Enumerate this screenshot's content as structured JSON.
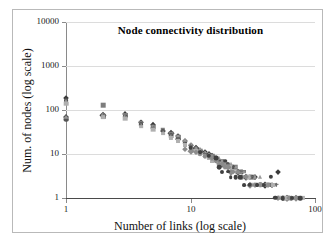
{
  "chart_data": {
    "type": "scatter",
    "title": "Node connectivity distribution",
    "xlabel": "Number of links (log scale)",
    "ylabel": "Num. of nodes (log scale)",
    "xscale": "log",
    "yscale": "log",
    "xlim": [
      1,
      100
    ],
    "ylim": [
      1,
      10000
    ],
    "xticks": [
      "1",
      "10",
      "100"
    ],
    "xtick_values": [
      1,
      10,
      100
    ],
    "yticks": [
      "1",
      "10",
      "100",
      "1000",
      "10000"
    ],
    "ytick_values": [
      1,
      10,
      100,
      1000,
      10000
    ],
    "grid": true,
    "grid_axis": "y",
    "legend": "none",
    "series": [
      {
        "name": "net-a",
        "marker": "diamond",
        "color": "#3a3a3a",
        "points": [
          [
            1,
            185
          ],
          [
            1,
            70
          ],
          [
            2,
            78
          ],
          [
            3,
            80
          ],
          [
            4,
            52
          ],
          [
            5,
            46
          ],
          [
            6,
            34
          ],
          [
            7,
            30
          ],
          [
            8,
            26
          ],
          [
            9,
            20
          ],
          [
            10,
            16
          ],
          [
            11,
            14
          ],
          [
            12,
            12
          ],
          [
            13,
            11
          ],
          [
            14,
            10
          ],
          [
            15,
            9
          ],
          [
            16,
            8
          ],
          [
            17,
            7
          ],
          [
            18,
            6
          ],
          [
            19,
            6
          ],
          [
            20,
            5
          ],
          [
            22,
            5
          ],
          [
            24,
            4
          ],
          [
            26,
            4
          ],
          [
            28,
            3
          ],
          [
            30,
            3
          ],
          [
            33,
            3
          ],
          [
            36,
            2
          ],
          [
            40,
            2
          ],
          [
            45,
            2
          ],
          [
            50,
            4
          ],
          [
            55,
            1
          ],
          [
            60,
            1
          ],
          [
            70,
            1
          ]
        ]
      },
      {
        "name": "net-b",
        "marker": "square",
        "color": "#7d7d7d",
        "points": [
          [
            1,
            150
          ],
          [
            1,
            64
          ],
          [
            2,
            130
          ],
          [
            2,
            72
          ],
          [
            3,
            76
          ],
          [
            4,
            50
          ],
          [
            5,
            42
          ],
          [
            6,
            36
          ],
          [
            7,
            28
          ],
          [
            8,
            24
          ],
          [
            9,
            19
          ],
          [
            10,
            15
          ],
          [
            11,
            13
          ],
          [
            12,
            12
          ],
          [
            13,
            10
          ],
          [
            14,
            9
          ],
          [
            15,
            9
          ],
          [
            16,
            8
          ],
          [
            17,
            7
          ],
          [
            18,
            7
          ],
          [
            19,
            6
          ],
          [
            21,
            5
          ],
          [
            23,
            5
          ],
          [
            25,
            4
          ],
          [
            27,
            4
          ],
          [
            29,
            3
          ],
          [
            32,
            3
          ],
          [
            35,
            2
          ],
          [
            38,
            2
          ],
          [
            42,
            2
          ],
          [
            48,
            2
          ],
          [
            52,
            1
          ],
          [
            58,
            1
          ],
          [
            66,
            1
          ],
          [
            75,
            1
          ]
        ]
      },
      {
        "name": "net-c",
        "marker": "circle",
        "color": "#555555",
        "points": [
          [
            1,
            170
          ],
          [
            1,
            60
          ],
          [
            2,
            74
          ],
          [
            3,
            70
          ],
          [
            4,
            48
          ],
          [
            5,
            40
          ],
          [
            6,
            33
          ],
          [
            7,
            27
          ],
          [
            8,
            22
          ],
          [
            9,
            18
          ],
          [
            10,
            14
          ],
          [
            11,
            13
          ],
          [
            12,
            11
          ],
          [
            13,
            10
          ],
          [
            14,
            9
          ],
          [
            15,
            8
          ],
          [
            16,
            7
          ],
          [
            17,
            7
          ],
          [
            18,
            6
          ],
          [
            20,
            6
          ],
          [
            22,
            5
          ],
          [
            24,
            4
          ],
          [
            26,
            3
          ],
          [
            28,
            3
          ],
          [
            31,
            3
          ],
          [
            34,
            2
          ],
          [
            37,
            2
          ],
          [
            41,
            2
          ],
          [
            46,
            2
          ],
          [
            51,
            1
          ],
          [
            57,
            1
          ],
          [
            64,
            1
          ],
          [
            72,
            1
          ]
        ]
      },
      {
        "name": "net-d",
        "marker": "triangle",
        "color": "#999999",
        "points": [
          [
            1,
            160
          ],
          [
            1,
            68
          ],
          [
            2,
            80
          ],
          [
            3,
            72
          ],
          [
            4,
            46
          ],
          [
            5,
            44
          ],
          [
            6,
            32
          ],
          [
            7,
            26
          ],
          [
            8,
            25
          ],
          [
            9,
            21
          ],
          [
            10,
            17
          ],
          [
            11,
            14
          ],
          [
            12,
            13
          ],
          [
            13,
            11
          ],
          [
            14,
            10
          ],
          [
            15,
            9
          ],
          [
            16,
            8
          ],
          [
            17,
            8
          ],
          [
            18,
            7
          ],
          [
            19,
            6
          ],
          [
            21,
            6
          ],
          [
            23,
            5
          ],
          [
            25,
            4
          ],
          [
            27,
            4
          ],
          [
            30,
            3
          ],
          [
            33,
            3
          ],
          [
            36,
            3
          ],
          [
            39,
            2
          ],
          [
            43,
            2
          ],
          [
            47,
            2
          ],
          [
            54,
            1
          ],
          [
            61,
            1
          ],
          [
            68,
            1
          ]
        ]
      },
      {
        "name": "net-e",
        "marker": "cross",
        "color": "#6a6a6a",
        "points": [
          [
            2,
            76
          ],
          [
            3,
            68
          ],
          [
            4,
            44
          ],
          [
            5,
            38
          ],
          [
            6,
            30
          ],
          [
            7,
            24
          ],
          [
            8,
            21
          ],
          [
            9,
            17
          ],
          [
            10,
            15
          ],
          [
            11,
            12
          ],
          [
            12,
            11
          ],
          [
            13,
            10
          ],
          [
            14,
            8
          ],
          [
            15,
            8
          ],
          [
            16,
            7
          ],
          [
            17,
            6
          ],
          [
            18,
            6
          ],
          [
            20,
            5
          ],
          [
            22,
            4
          ],
          [
            25,
            4
          ],
          [
            28,
            3
          ],
          [
            31,
            3
          ],
          [
            34,
            2
          ],
          [
            38,
            2
          ],
          [
            44,
            2
          ],
          [
            49,
            2
          ],
          [
            56,
            1
          ],
          [
            63,
            1
          ],
          [
            78,
            1
          ]
        ]
      },
      {
        "name": "net-f",
        "marker": "square",
        "color": "#b0b0b0",
        "points": [
          [
            1,
            140
          ],
          [
            2,
            70
          ],
          [
            3,
            64
          ],
          [
            4,
            42
          ],
          [
            5,
            36
          ],
          [
            6,
            29
          ],
          [
            7,
            23
          ],
          [
            8,
            20
          ],
          [
            9,
            16
          ],
          [
            10,
            13
          ],
          [
            11,
            12
          ],
          [
            12,
            10
          ],
          [
            13,
            9
          ],
          [
            14,
            8
          ],
          [
            15,
            7
          ],
          [
            16,
            7
          ],
          [
            17,
            6
          ],
          [
            19,
            5
          ],
          [
            21,
            5
          ],
          [
            23,
            4
          ],
          [
            26,
            3
          ],
          [
            29,
            3
          ],
          [
            32,
            2
          ],
          [
            36,
            2
          ],
          [
            40,
            2
          ],
          [
            46,
            2
          ],
          [
            53,
            1
          ],
          [
            59,
            1
          ],
          [
            67,
            1
          ],
          [
            80,
            1
          ]
        ]
      },
      {
        "name": "net-g",
        "marker": "diamond",
        "color": "#8c8c8c",
        "points": [
          [
            9,
            13
          ],
          [
            10,
            12
          ],
          [
            11,
            11
          ],
          [
            12,
            10
          ],
          [
            13,
            9
          ],
          [
            14,
            9
          ],
          [
            15,
            8
          ],
          [
            16,
            7
          ],
          [
            17,
            6
          ],
          [
            18,
            6
          ],
          [
            19,
            5
          ],
          [
            20,
            5
          ],
          [
            21,
            4
          ],
          [
            22,
            4
          ],
          [
            24,
            4
          ],
          [
            26,
            3
          ],
          [
            28,
            3
          ],
          [
            30,
            2
          ],
          [
            33,
            2
          ],
          [
            37,
            2
          ],
          [
            42,
            2
          ],
          [
            50,
            1
          ],
          [
            62,
            1
          ],
          [
            71,
            1
          ]
        ]
      },
      {
        "name": "net-h",
        "marker": "circle",
        "color": "#404040",
        "points": [
          [
            10,
            14
          ],
          [
            12,
            11
          ],
          [
            14,
            9
          ],
          [
            16,
            8
          ],
          [
            17,
            5
          ],
          [
            18,
            4
          ],
          [
            19,
            7
          ],
          [
            20,
            4
          ],
          [
            21,
            3
          ],
          [
            23,
            3
          ],
          [
            25,
            3
          ],
          [
            27,
            2
          ],
          [
            30,
            2
          ],
          [
            34,
            2
          ],
          [
            39,
            2
          ],
          [
            44,
            3
          ],
          [
            48,
            1
          ],
          [
            55,
            1
          ],
          [
            65,
            1
          ],
          [
            76,
            1
          ]
        ]
      }
    ]
  },
  "axes": {
    "ytick_labels": [
      "10000",
      "1000",
      "100",
      "10",
      "1"
    ],
    "xtick_labels": [
      "1",
      "10",
      "100"
    ]
  }
}
